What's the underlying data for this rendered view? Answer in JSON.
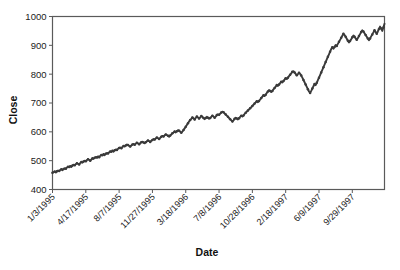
{
  "chart_data": {
    "type": "line",
    "title": "",
    "xlabel": "Date",
    "ylabel": "Close",
    "grid": false,
    "legend": "none",
    "ylim": [
      400,
      1000
    ],
    "yticks": [
      400,
      500,
      600,
      700,
      800,
      900,
      1000
    ],
    "ytick_labels": [
      "400",
      "500",
      "600",
      "700",
      "800",
      "900",
      "1000"
    ],
    "xtick_labels": [
      "1/3/1995",
      "4/17/1995",
      "8/7/1995",
      "11/27/1995",
      "3/18/1996",
      "7/8/1996",
      "10/28/1996",
      "2/18/1997",
      "6/9/1997",
      "9/29/1997"
    ],
    "xtick_index": [
      0,
      30,
      60,
      90,
      120,
      150,
      180,
      210,
      240,
      270
    ],
    "n_points": 290,
    "series": [
      {
        "name": "Close",
        "color": "#3a3a3a",
        "marker": "circle",
        "values": [
          458,
          460,
          462,
          459,
          463,
          466,
          464,
          468,
          470,
          467,
          471,
          474,
          472,
          476,
          479,
          477,
          481,
          478,
          483,
          486,
          484,
          488,
          491,
          489,
          487,
          492,
          495,
          493,
          497,
          500,
          498,
          502,
          505,
          503,
          500,
          504,
          508,
          506,
          510,
          513,
          511,
          515,
          512,
          517,
          520,
          518,
          522,
          519,
          524,
          527,
          525,
          529,
          532,
          530,
          534,
          531,
          536,
          539,
          537,
          541,
          544,
          546,
          543,
          548,
          551,
          549,
          553,
          556,
          554,
          551,
          549,
          553,
          556,
          558,
          555,
          559,
          562,
          560,
          557,
          561,
          564,
          566,
          563,
          560,
          564,
          567,
          570,
          568,
          565,
          569,
          572,
          575,
          573,
          577,
          580,
          578,
          575,
          579,
          583,
          586,
          584,
          588,
          591,
          589,
          586,
          583,
          587,
          591,
          595,
          598,
          601,
          598,
          602,
          606,
          604,
          600,
          597,
          601,
          606,
          612,
          618,
          624,
          630,
          636,
          641,
          645,
          650,
          647,
          643,
          648,
          653,
          650,
          646,
          650,
          655,
          652,
          648,
          644,
          648,
          652,
          649,
          645,
          648,
          652,
          656,
          653,
          649,
          653,
          658,
          661,
          659,
          663,
          667,
          670,
          668,
          664,
          660,
          656,
          652,
          648,
          644,
          640,
          636,
          640,
          645,
          649,
          646,
          643,
          647,
          652,
          656,
          653,
          657,
          662,
          666,
          670,
          674,
          678,
          682,
          686,
          690,
          694,
          698,
          702,
          706,
          703,
          707,
          712,
          717,
          722,
          727,
          724,
          729,
          735,
          740,
          745,
          742,
          738,
          742,
          747,
          752,
          757,
          762,
          759,
          764,
          769,
          774,
          771,
          776,
          781,
          786,
          783,
          788,
          793,
          798,
          803,
          808,
          810,
          806,
          801,
          796,
          800,
          805,
          801,
          795,
          788,
          780,
          772,
          764,
          756,
          748,
          740,
          735,
          742,
          750,
          758,
          766,
          762,
          770,
          779,
          788,
          797,
          806,
          815,
          824,
          833,
          842,
          851,
          860,
          869,
          878,
          887,
          893,
          888,
          894,
          901,
          898,
          905,
          912,
          919,
          926,
          933,
          940,
          936,
          930,
          923,
          916,
          910,
          915,
          921,
          928,
          934,
          930,
          924,
          919,
          925,
          932,
          939,
          946,
          952,
          948,
          942,
          936,
          930,
          924,
          918,
          924,
          931,
          938,
          945,
          952,
          946,
          940,
          948,
          957,
          965,
          958,
          950,
          962,
          975
        ]
      }
    ]
  },
  "labels": {
    "y_axis_title": "Close",
    "x_axis_title": "Date"
  }
}
